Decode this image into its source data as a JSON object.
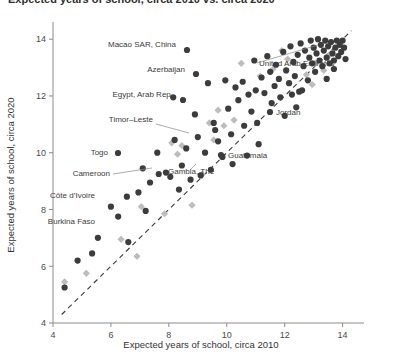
{
  "title": {
    "text": "Expected years of school, circa 2010 vs. circa 2020",
    "clipped": true
  },
  "axes": {
    "x_label": "Expected years of school, circa 2010",
    "y_label": "Expected years of school, circa 2020",
    "x_ticks": [
      "4",
      "6",
      "8",
      "10",
      "12",
      "14"
    ],
    "y_ticks": [
      "4",
      "6",
      "8",
      "10",
      "12",
      "14"
    ]
  },
  "colors": {
    "circle": "#3c3c3c",
    "diamond": "#bdbdbd",
    "axis": "#8c8c8c",
    "reference_line": "#3a3a3a",
    "text": "#3b3b3b",
    "background": "#ffffff"
  },
  "annotations": [
    {
      "label": "Macao SAR, China",
      "x": 11.0,
      "y": 13.2
    },
    {
      "label": "Azerbaijan",
      "x": 10.6,
      "y": 12.5
    },
    {
      "label": "Egypt, Arab Rep.",
      "x": 10.1,
      "y": 11.6
    },
    {
      "label": "United Arab Emirates",
      "x": 13.1,
      "y": 12.8
    },
    {
      "label": "Timor-Leste",
      "x": 9.6,
      "y": 10.8
    },
    {
      "label": "Jordan",
      "x": 12.0,
      "y": 11.3
    },
    {
      "label": "Togo",
      "x": 7.6,
      "y": 10.0
    },
    {
      "label": "Guatemala",
      "x": 10.2,
      "y": 9.6
    },
    {
      "label": "Cameroon",
      "x": 7.9,
      "y": 9.3
    },
    {
      "label": "Gambia, The",
      "x": 9.1,
      "y": 9.2
    },
    {
      "label": "Cote d'Ivoire",
      "x": 6.0,
      "y": 8.1
    },
    {
      "label": "Burkina Faso",
      "x": 5.8,
      "y": 7.0
    }
  ],
  "chart_data": {
    "type": "scatter",
    "title": "Expected years of school, circa 2010 vs. circa 2020",
    "xlabel": "Expected years of school, circa 2010",
    "ylabel": "Expected years of school, circa 2020",
    "xlim": [
      4,
      14.6
    ],
    "ylim": [
      4,
      14.5
    ],
    "grid": false,
    "legend": "none",
    "reference_line": {
      "type": "identity",
      "style": "dashed",
      "from": [
        4.3,
        4.3
      ],
      "to": [
        14.3,
        14.3
      ]
    },
    "series": [
      {
        "name": "circle-markers",
        "marker": "circle",
        "color": "#3c3c3c",
        "points": [
          [
            4.4,
            5.25
          ],
          [
            4.85,
            6.2
          ],
          [
            5.35,
            6.45
          ],
          [
            5.55,
            7.0
          ],
          [
            6.0,
            8.1
          ],
          [
            6.25,
            7.75
          ],
          [
            6.55,
            8.45
          ],
          [
            6.6,
            6.85
          ],
          [
            6.95,
            8.6
          ],
          [
            7.1,
            9.45
          ],
          [
            7.2,
            7.95
          ],
          [
            7.35,
            8.95
          ],
          [
            7.6,
            10.0
          ],
          [
            7.65,
            9.25
          ],
          [
            7.9,
            9.3
          ],
          [
            8.05,
            9.15
          ],
          [
            8.2,
            10.45
          ],
          [
            8.35,
            8.7
          ],
          [
            8.45,
            9.55
          ],
          [
            8.6,
            10.15
          ],
          [
            8.75,
            9.05
          ],
          [
            8.9,
            11.35
          ],
          [
            9.0,
            10.55
          ],
          [
            9.1,
            9.2
          ],
          [
            9.25,
            10.0
          ],
          [
            9.35,
            12.45
          ],
          [
            9.55,
            11.05
          ],
          [
            9.6,
            10.8
          ],
          [
            9.7,
            10.4
          ],
          [
            9.85,
            9.85
          ],
          [
            9.95,
            12.55
          ],
          [
            10.05,
            11.55
          ],
          [
            10.15,
            10.65
          ],
          [
            10.2,
            9.6
          ],
          [
            10.3,
            12.3
          ],
          [
            10.4,
            11.85
          ],
          [
            10.55,
            12.5
          ],
          [
            10.6,
            10.95
          ],
          [
            10.75,
            12.05
          ],
          [
            10.85,
            11.45
          ],
          [
            10.95,
            13.25
          ],
          [
            11.0,
            12.2
          ],
          [
            11.05,
            11.05
          ],
          [
            11.2,
            12.65
          ],
          [
            11.3,
            12.1
          ],
          [
            11.4,
            13.4
          ],
          [
            11.5,
            12.85
          ],
          [
            11.55,
            11.75
          ],
          [
            11.65,
            12.35
          ],
          [
            11.7,
            13.1
          ],
          [
            11.8,
            12.6
          ],
          [
            11.85,
            11.95
          ],
          [
            11.95,
            13.55
          ],
          [
            12.0,
            11.3
          ],
          [
            12.05,
            12.9
          ],
          [
            12.15,
            12.45
          ],
          [
            12.2,
            13.75
          ],
          [
            12.3,
            13.2
          ],
          [
            12.35,
            12.7
          ],
          [
            12.45,
            13.45
          ],
          [
            12.5,
            12.15
          ],
          [
            12.55,
            13.85
          ],
          [
            12.65,
            13.05
          ],
          [
            12.7,
            13.6
          ],
          [
            12.8,
            12.55
          ],
          [
            12.85,
            13.35
          ],
          [
            12.9,
            13.95
          ],
          [
            12.95,
            13.15
          ],
          [
            13.0,
            13.7
          ],
          [
            13.05,
            12.85
          ],
          [
            13.1,
            13.5
          ],
          [
            13.15,
            14.0
          ],
          [
            13.2,
            13.25
          ],
          [
            13.25,
            13.8
          ],
          [
            13.3,
            13.05
          ],
          [
            13.35,
            13.6
          ],
          [
            13.4,
            13.95
          ],
          [
            13.45,
            13.35
          ],
          [
            13.5,
            13.75
          ],
          [
            13.55,
            13.15
          ],
          [
            13.6,
            13.9
          ],
          [
            13.65,
            13.5
          ],
          [
            13.7,
            13.25
          ],
          [
            13.75,
            13.7
          ],
          [
            13.8,
            13.95
          ],
          [
            13.85,
            13.4
          ],
          [
            13.9,
            13.8
          ],
          [
            13.95,
            13.55
          ],
          [
            14.0,
            13.95
          ],
          [
            14.05,
            13.7
          ],
          [
            14.1,
            13.3
          ],
          [
            12.4,
            11.6
          ],
          [
            11.1,
            10.3
          ],
          [
            10.7,
            9.9
          ],
          [
            9.45,
            9.4
          ],
          [
            8.15,
            11.95
          ],
          [
            12.6,
            12.2
          ],
          [
            13.45,
            12.6
          ],
          [
            13.7,
            12.95
          ],
          [
            12.25,
            12.05
          ]
        ]
      },
      {
        "name": "diamond-markers",
        "marker": "diamond",
        "color": "#bdbdbd",
        "points": [
          [
            4.4,
            5.45
          ],
          [
            5.15,
            5.75
          ],
          [
            6.35,
            6.95
          ],
          [
            6.9,
            6.35
          ],
          [
            7.05,
            8.1
          ],
          [
            7.85,
            7.85
          ],
          [
            8.1,
            10.35
          ],
          [
            8.45,
            10.25
          ],
          [
            8.8,
            8.15
          ],
          [
            9.4,
            11.05
          ],
          [
            9.55,
            10.45
          ],
          [
            9.7,
            11.5
          ],
          [
            9.9,
            10.95
          ],
          [
            10.25,
            11.15
          ],
          [
            10.5,
            13.15
          ],
          [
            11.15,
            12.7
          ],
          [
            11.6,
            12.95
          ],
          [
            12.1,
            13.3
          ],
          [
            12.75,
            12.75
          ],
          [
            13.05,
            13.15
          ],
          [
            13.35,
            12.9
          ],
          [
            13.55,
            13.45
          ],
          [
            9.15,
            9.25
          ],
          [
            8.3,
            9.95
          ],
          [
            11.9,
            13.6
          ],
          [
            12.95,
            12.4
          ]
        ]
      }
    ]
  }
}
